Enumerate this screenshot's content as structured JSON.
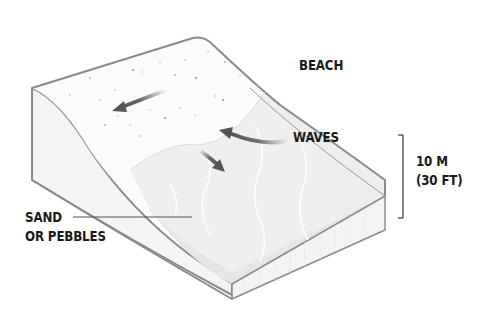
{
  "diagram": {
    "labels": {
      "beach": "BEACH",
      "waves": "WAVES",
      "height_line1": "10 M",
      "height_line2": "(30 FT)",
      "sand_line1": "SAND",
      "sand_line2": "OR PEBBLES"
    },
    "arrows": [
      {
        "name": "backwash-arrow",
        "direction": "up-slope-to-down-left"
      },
      {
        "name": "wave-arrow",
        "direction": "curved-left"
      },
      {
        "name": "swash-arrow",
        "direction": "down-right"
      }
    ],
    "colors": {
      "outline": "#8a8a8a",
      "beach_top": "#fbfbfb",
      "water_surface": "#eeeeee",
      "water_front": "#e2e2e2",
      "side_face": "#f4f4f4",
      "arrow": "#555555",
      "text": "#1a1a1a"
    }
  }
}
